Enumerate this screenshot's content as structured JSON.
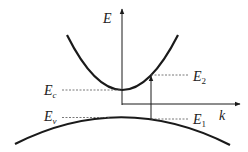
{
  "diagram": {
    "axes": {
      "y_label": "E",
      "x_label": "k"
    },
    "levels": {
      "conduction_min": {
        "label": "E",
        "sub": "c"
      },
      "valence_max": {
        "label": "E",
        "sub": "v"
      },
      "final_state": {
        "label": "E",
        "sub": "2"
      },
      "initial_state": {
        "label": "E",
        "sub": "1"
      }
    },
    "curves": [
      {
        "name": "conduction-band",
        "shape": "upward parabola"
      },
      {
        "name": "valence-band",
        "shape": "downward parabola"
      }
    ],
    "transition": {
      "from": "E1",
      "to": "E2",
      "direction": "vertical"
    },
    "colors": {
      "line": "#1a1a1a",
      "dashed": "#555555",
      "background": "#ffffff"
    }
  }
}
